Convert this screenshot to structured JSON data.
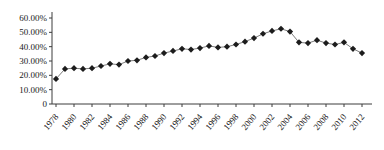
{
  "chart_data": {
    "type": "line",
    "title": "",
    "xlabel": "",
    "ylabel": "",
    "x": [
      1978,
      1979,
      1980,
      1981,
      1982,
      1983,
      1984,
      1985,
      1986,
      1987,
      1988,
      1989,
      1990,
      1991,
      1992,
      1993,
      1994,
      1995,
      1996,
      1997,
      1998,
      1999,
      2000,
      2001,
      2002,
      2003,
      2004,
      2005,
      2006,
      2007,
      2008,
      2009,
      2010,
      2011,
      2012
    ],
    "values": [
      17.5,
      24.5,
      25.0,
      24.5,
      25.0,
      26.5,
      28.0,
      27.5,
      30.0,
      30.5,
      32.5,
      33.5,
      35.5,
      37.0,
      38.5,
      38.0,
      39.0,
      40.5,
      39.5,
      40.0,
      41.5,
      43.5,
      46.0,
      49.0,
      51.0,
      52.5,
      50.5,
      43.0,
      42.5,
      44.5,
      42.5,
      41.5,
      43.0,
      38.5,
      35.5
    ],
    "ylim": [
      0,
      60
    ],
    "y_ticks": [
      0,
      10,
      20,
      30,
      40,
      50,
      60
    ],
    "y_tick_labels": [
      "0",
      "10.00%",
      "20.00%",
      "30.00%",
      "40.00%",
      "50.00%",
      "60.00%"
    ],
    "x_tick_years": [
      1978,
      1980,
      1982,
      1984,
      1986,
      1988,
      1990,
      1992,
      1994,
      1996,
      1998,
      2000,
      2002,
      2004,
      2006,
      2008,
      2010,
      2012
    ],
    "marker": "diamond",
    "grid": false,
    "legend": "none",
    "colors": {
      "line": "#7d7d7d",
      "marker": "#1c1c1c",
      "axis": "#3c3c3c",
      "label": "#1a1a1a"
    }
  }
}
